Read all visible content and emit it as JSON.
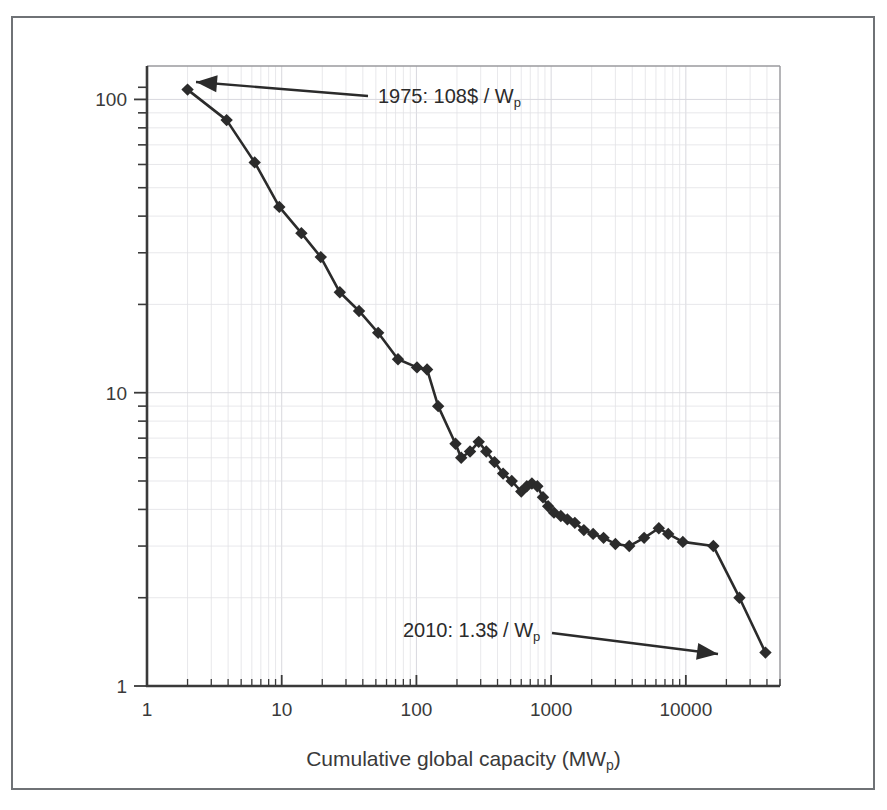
{
  "figure": {
    "background_color": "#ffffff",
    "frame_color": "#6f7276",
    "grid_color": "#e2e2e6",
    "axis_color": "#3a3a3a",
    "series_color": "#2b2b2b"
  },
  "axes": {
    "x": {
      "label_main": "Cumulative global capacity (MW",
      "label_sub": "p",
      "label_tail": ")",
      "scale": "log",
      "ticks": [
        1,
        10,
        100,
        1000,
        10000
      ],
      "tick_labels": [
        "1",
        "10",
        "100",
        "1000",
        "10000"
      ],
      "range": [
        1,
        50000
      ]
    },
    "y": {
      "label_main": "",
      "scale": "log",
      "ticks": [
        1,
        10,
        100
      ],
      "tick_labels": [
        "1",
        "10",
        "100"
      ],
      "range": [
        1,
        130
      ]
    }
  },
  "annotations": [
    {
      "name": "start-annotation",
      "text_main": "1975: 108$ / W",
      "text_sub": "p",
      "text_x": 378,
      "text_y": 103,
      "arrow_from_x": 368,
      "arrow_from_y": 96,
      "arrow_to_x": 196,
      "arrow_to_y": 82
    },
    {
      "name": "end-annotation",
      "text_main": "2010: 1.3$ / W",
      "text_sub": "p",
      "text_x": 403,
      "text_y": 637,
      "arrow_from_x": 552,
      "arrow_from_y": 633,
      "arrow_to_x": 718,
      "arrow_to_y": 654
    }
  ],
  "chart_data": {
    "type": "line",
    "title": "",
    "xlabel": "Cumulative global capacity (MWp)",
    "ylabel": "Module price ($/Wp)",
    "xlim": [
      1,
      50000
    ],
    "ylim": [
      1,
      130
    ],
    "xscale": "log",
    "yscale": "log",
    "grid": true,
    "legend": "none",
    "marker": "diamond",
    "series": [
      {
        "name": "PV module price experience curve",
        "x": [
          2.0,
          3.9,
          6.3,
          9.6,
          14.0,
          19.5,
          27.0,
          37.5,
          52.0,
          73.0,
          101.0,
          120.0,
          145.0,
          195.0,
          215.0,
          250.0,
          290.0,
          330.0,
          380.0,
          440.0,
          510.0,
          600.0,
          660.0,
          720.0,
          790.0,
          870.0,
          950.0,
          1050.0,
          1180.0,
          1320.0,
          1500.0,
          1750.0,
          2050.0,
          2450.0,
          3000.0,
          3800.0,
          4900.0,
          6300.0,
          7400.0,
          9500.0,
          16000.0,
          25000.0,
          39000.0
        ],
        "y": [
          108.0,
          85.0,
          61.0,
          43.0,
          35.0,
          29.0,
          22.0,
          19.0,
          16.0,
          13.0,
          12.2,
          12.0,
          9.0,
          6.7,
          6.0,
          6.3,
          6.8,
          6.3,
          5.8,
          5.3,
          5.0,
          4.6,
          4.8,
          4.9,
          4.8,
          4.4,
          4.1,
          3.9,
          3.8,
          3.7,
          3.6,
          3.4,
          3.3,
          3.2,
          3.05,
          3.0,
          3.2,
          3.45,
          3.3,
          3.1,
          3.0,
          2.0,
          1.3
        ],
        "labels": [
          "1975",
          "",
          "",
          "",
          "",
          "",
          "",
          "",
          "",
          "",
          "",
          "",
          "",
          "",
          "",
          "",
          "",
          "",
          "",
          "",
          "",
          "",
          "",
          "",
          "",
          "",
          "",
          "",
          "",
          "",
          "",
          "",
          "",
          "",
          "",
          "",
          "",
          "",
          "",
          "",
          "",
          "",
          "2010"
        ]
      }
    ]
  }
}
